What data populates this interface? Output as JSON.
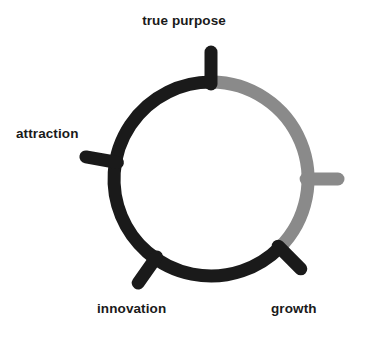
{
  "diagram": {
    "type": "radial-cycle",
    "title": "",
    "canvas": {
      "width": 368,
      "height": 337,
      "background": "#ffffff"
    },
    "circle": {
      "center_x": 211,
      "center_y": 179,
      "radius": 97,
      "stroke_width": 13,
      "cap": "round"
    },
    "colors": {
      "dark": "#1a1a1a",
      "gray": "#8a8a8a",
      "text": "#1a1a1a",
      "background": "#ffffff"
    },
    "arcs": [
      {
        "name": "dark-arc",
        "color": "#1a1a1a",
        "start_angle_deg": 135,
        "end_angle_deg": 360,
        "description": "black arc from growth tick counter-clockwise through innovation, attraction, up to true purpose"
      },
      {
        "name": "gray-arc",
        "color": "#8a8a8a",
        "start_angle_deg": 0,
        "end_angle_deg": 135,
        "description": "gray arc from true purpose clockwise through the unlabeled right tick down to growth"
      }
    ],
    "ticks": [
      {
        "name": "tick-true-purpose",
        "angle_deg": 0,
        "color": "#1a1a1a",
        "length": 30,
        "label": "true purpose"
      },
      {
        "name": "tick-right-unlabeled",
        "angle_deg": 90,
        "color": "#8a8a8a",
        "length": 30,
        "label": ""
      },
      {
        "name": "tick-growth",
        "angle_deg": 135,
        "color": "#1a1a1a",
        "length": 30,
        "label": "growth"
      },
      {
        "name": "tick-innovation",
        "angle_deg": 215,
        "color": "#1a1a1a",
        "length": 30,
        "label": "innovation"
      },
      {
        "name": "tick-attraction",
        "angle_deg": 280,
        "color": "#1a1a1a",
        "length": 30,
        "label": "attraction"
      }
    ],
    "labels": {
      "true_purpose": "true purpose",
      "attraction": "attraction",
      "innovation": "innovation",
      "growth": "growth"
    }
  }
}
